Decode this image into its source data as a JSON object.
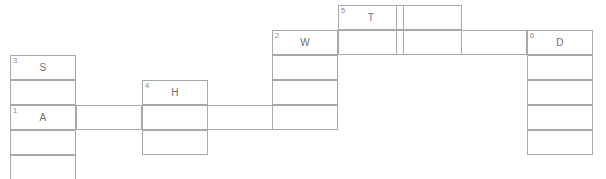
{
  "puzzle": {
    "title": "Crossword Grid",
    "cell_width": 66,
    "cell_height": 25,
    "grid_line_color": "#a8a8a8",
    "number_color": "#8a8a8a",
    "letter_color": "#6f6f6f",
    "background_color": "#ffffff"
  },
  "cells": [
    {
      "id": "c-5-0",
      "x": 338,
      "y": 5,
      "number": "5",
      "letter": "T"
    },
    {
      "id": "c-5-1",
      "x": 396,
      "y": 5,
      "number": "",
      "letter": ""
    },
    {
      "id": "c-2-0",
      "x": 272,
      "y": 30,
      "number": "2",
      "letter": "W"
    },
    {
      "id": "c-r2-1",
      "x": 338,
      "y": 30,
      "number": "",
      "letter": ""
    },
    {
      "id": "c-r2-2",
      "x": 396,
      "y": 30,
      "number": "",
      "letter": ""
    },
    {
      "id": "c-r2-3",
      "x": 461,
      "y": 30,
      "number": "",
      "letter": ""
    },
    {
      "id": "c-6-0",
      "x": 527,
      "y": 30,
      "number": "6",
      "letter": "D"
    },
    {
      "id": "c-3-0",
      "x": 10,
      "y": 55,
      "number": "3",
      "letter": "S"
    },
    {
      "id": "c-2-1",
      "x": 272,
      "y": 55,
      "number": "",
      "letter": ""
    },
    {
      "id": "c-6-1",
      "x": 527,
      "y": 55,
      "number": "",
      "letter": ""
    },
    {
      "id": "c-3-1",
      "x": 10,
      "y": 80,
      "number": "",
      "letter": ""
    },
    {
      "id": "c-4-0",
      "x": 142,
      "y": 80,
      "number": "4",
      "letter": "H"
    },
    {
      "id": "c-2-2",
      "x": 272,
      "y": 80,
      "number": "",
      "letter": ""
    },
    {
      "id": "c-6-2",
      "x": 527,
      "y": 80,
      "number": "",
      "letter": ""
    },
    {
      "id": "c-1-0",
      "x": 10,
      "y": 105,
      "number": "1",
      "letter": "A"
    },
    {
      "id": "c-1-1",
      "x": 76,
      "y": 105,
      "number": "",
      "letter": ""
    },
    {
      "id": "c-1-2",
      "x": 142,
      "y": 105,
      "number": "",
      "letter": ""
    },
    {
      "id": "c-1-3",
      "x": 207,
      "y": 105,
      "number": "",
      "letter": ""
    },
    {
      "id": "c-1-4",
      "x": 272,
      "y": 105,
      "number": "",
      "letter": ""
    },
    {
      "id": "c-6-3",
      "x": 527,
      "y": 105,
      "number": "",
      "letter": ""
    },
    {
      "id": "c-3-3",
      "x": 10,
      "y": 130,
      "number": "",
      "letter": ""
    },
    {
      "id": "c-4-2",
      "x": 142,
      "y": 130,
      "number": "",
      "letter": ""
    },
    {
      "id": "c-6-4",
      "x": 527,
      "y": 130,
      "number": "",
      "letter": ""
    },
    {
      "id": "c-3-4",
      "x": 10,
      "y": 155,
      "number": "",
      "letter": ""
    }
  ]
}
